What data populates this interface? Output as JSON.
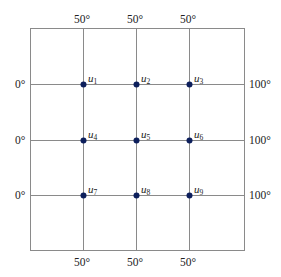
{
  "diagram": {
    "type": "grid-boundary-value-problem",
    "colors": {
      "line": "#8a8a8a",
      "node": "#0d1f5c",
      "text": "#222222"
    },
    "boundary": {
      "top": [
        "50°",
        "50°",
        "50°"
      ],
      "bottom": [
        "50°",
        "50°",
        "50°"
      ],
      "left": [
        "0°",
        "0°",
        "0°"
      ],
      "right": [
        "100°",
        "100°",
        "100°"
      ]
    },
    "nodes": [
      {
        "name": "u",
        "sub": "1"
      },
      {
        "name": "u",
        "sub": "2"
      },
      {
        "name": "u",
        "sub": "3"
      },
      {
        "name": "u",
        "sub": "4"
      },
      {
        "name": "u",
        "sub": "5"
      },
      {
        "name": "u",
        "sub": "6"
      },
      {
        "name": "u",
        "sub": "7"
      },
      {
        "name": "u",
        "sub": "8"
      },
      {
        "name": "u",
        "sub": "9"
      }
    ]
  }
}
